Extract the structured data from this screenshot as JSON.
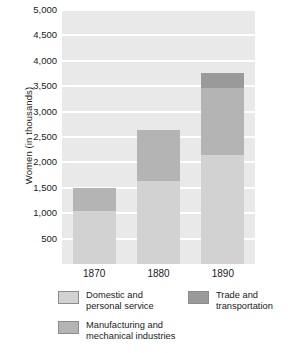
{
  "chart_data": {
    "type": "bar",
    "stacked": true,
    "title": "",
    "xlabel": "",
    "ylabel": "Women (in thousands)",
    "categories": [
      "1870",
      "1880",
      "1890"
    ],
    "ylim": [
      0,
      5000
    ],
    "yticks": [
      500,
      1000,
      1500,
      2000,
      2500,
      3000,
      3500,
      4000,
      4500,
      5000
    ],
    "ytick_labels": [
      "500",
      "1,000",
      "1,500",
      "2,000",
      "2,500",
      "3,000",
      "3,500",
      "4,000",
      "4,500",
      "5,000"
    ],
    "grid": true,
    "grid_axis": "y",
    "legend_position": "below",
    "series": [
      {
        "name": "Domestic and\npersonal service",
        "color": "#d2d2d2",
        "values": [
          1050,
          1630,
          2150
        ]
      },
      {
        "name": "Manufacturing and\nmechanical industries",
        "color": "#b4b4b4",
        "values": [
          450,
          1000,
          1320
        ]
      },
      {
        "name": "Trade and\ntransportation",
        "color": "#9a9a9a",
        "values": [
          0,
          0,
          290
        ]
      }
    ],
    "totals": [
      1500,
      2630,
      3760
    ],
    "plot_background": "#e9e9e9",
    "gridline_color": "#ffffff"
  },
  "legend": {
    "items": [
      {
        "label": "Domestic and\npersonal service",
        "color": "#d2d2d2"
      },
      {
        "label": "Trade and\ntransportation",
        "color": "#9a9a9a"
      },
      {
        "label": "Manufacturing and\nmechanical industries",
        "color": "#b4b4b4"
      }
    ]
  }
}
